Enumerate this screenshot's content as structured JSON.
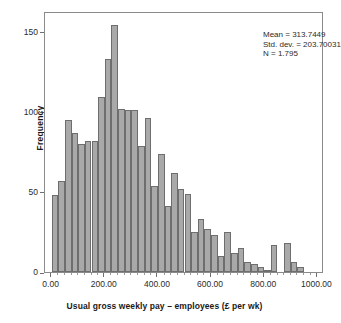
{
  "chart_data": {
    "type": "bar",
    "title": "",
    "xlabel": "Usual gross weekly pay – employees (£ per wk)",
    "ylabel": "Frequency",
    "xlim": [
      -25,
      1025
    ],
    "ylim": [
      0,
      163
    ],
    "grid": false,
    "legend": null,
    "bin_width": 25,
    "xticks": [
      0,
      200,
      400,
      600,
      800,
      1000
    ],
    "xtick_labels": [
      "0.00",
      "200.00",
      "400.00",
      "600.00",
      "800.00",
      "1000.00"
    ],
    "yticks": [
      0,
      50,
      100,
      150
    ],
    "ytick_labels": [
      "0",
      "50",
      "100",
      "150"
    ],
    "bin_starts": [
      0,
      25,
      50,
      75,
      100,
      125,
      150,
      175,
      200,
      225,
      250,
      275,
      300,
      325,
      350,
      375,
      400,
      425,
      450,
      475,
      500,
      525,
      550,
      575,
      600,
      625,
      650,
      675,
      700,
      725,
      750,
      775,
      800,
      825,
      850,
      875,
      900,
      925,
      950,
      975
    ],
    "categories": [
      "0-25",
      "25-50",
      "50-75",
      "75-100",
      "100-125",
      "125-150",
      "150-175",
      "175-200",
      "200-225",
      "225-250",
      "250-275",
      "275-300",
      "300-325",
      "325-350",
      "350-375",
      "375-400",
      "400-425",
      "425-450",
      "450-475",
      "475-500",
      "500-525",
      "525-550",
      "550-575",
      "575-600",
      "600-625",
      "625-650",
      "650-675",
      "675-700",
      "700-725",
      "725-750",
      "750-775",
      "775-800",
      "800-825",
      "825-850",
      "850-875",
      "875-900",
      "900-925",
      "925-950",
      "950-975",
      "975-1000"
    ],
    "values": [
      48,
      57,
      95,
      87,
      80,
      82,
      82,
      109,
      133,
      154,
      102,
      101,
      101,
      79,
      96,
      54,
      74,
      41,
      62,
      52,
      49,
      25,
      33,
      27,
      23,
      10,
      25,
      12,
      15,
      6,
      5,
      3,
      1,
      17,
      0,
      18,
      6,
      3,
      0,
      0
    ],
    "annotations": [
      "Mean = 313.7449",
      "Std. dev. = 203.70031",
      "N = 1.795"
    ],
    "bar_color": "#a9a9a9",
    "bar_edge_color": "#6e6e6e",
    "frame_color": "#8a8a8a"
  },
  "stats": {
    "mean_line": "Mean = 313.7449",
    "std_line": "Std. dev. = 203.70031",
    "n_line": "N = 1.795"
  },
  "axes": {
    "x_title": "Usual gross weekly pay – employees (£ per wk)",
    "y_title": "Frequency"
  }
}
